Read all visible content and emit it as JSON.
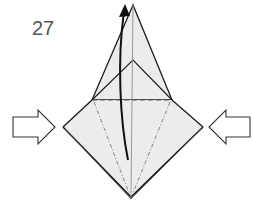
{
  "diagram": {
    "type": "origami-instruction-step",
    "step_number": "27",
    "colors": {
      "paper_fill": "#ececec",
      "line": "#1a1a1a",
      "crease": "#888888",
      "step_number": "#555555"
    },
    "elements": [
      {
        "name": "step-number",
        "text": "27"
      },
      {
        "name": "push-arrow-left",
        "direction": "right"
      },
      {
        "name": "push-arrow-right",
        "direction": "left"
      },
      {
        "name": "fold-up-arrow",
        "direction": "up"
      },
      {
        "name": "valley-fold-line",
        "style": "dashed"
      },
      {
        "name": "mountain-fold-lines",
        "style": "dash-dot"
      }
    ]
  }
}
